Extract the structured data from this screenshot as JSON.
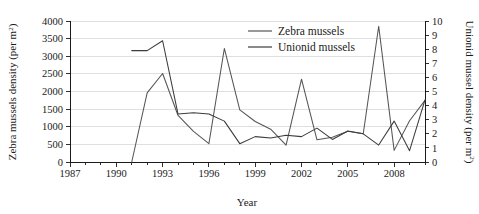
{
  "figure": {
    "background": "#ffffff",
    "plot": {
      "x_px": 70,
      "y_px": 21,
      "w_px": 355,
      "h_px": 141,
      "grid": true
    }
  },
  "axes": {
    "x": {
      "label": "Year",
      "min": 1987,
      "max": 2010,
      "tick_interval_minor": 1,
      "tick_interval_major": 3,
      "major_ticks": [
        1987,
        1990,
        1993,
        1996,
        1999,
        2002,
        2005,
        2008
      ],
      "tick_labels": [
        "1987",
        "1990",
        "1993",
        "1996",
        "1999",
        "2002",
        "2005",
        "2008"
      ]
    },
    "y_left": {
      "label_main": "Zebra mussels density (per m",
      "label_sup": "2",
      "label_close": ")",
      "label_full": "Zebra mussels density (per m²)",
      "min": 0,
      "max": 4000,
      "tick_interval": 500,
      "ticks": [
        0,
        500,
        1000,
        1500,
        2000,
        2500,
        3000,
        3500,
        4000
      ],
      "tick_labels": [
        "0",
        "500",
        "1000",
        "1500",
        "2000",
        "2500",
        "3000",
        "3500",
        "4000"
      ]
    },
    "y_right": {
      "label_main": "Unionid mussel density (per m",
      "label_sup": "2",
      "label_close": ")",
      "label_full": "Unionid mussel density (per m²)",
      "min": 0,
      "max": 10,
      "tick_interval": 1,
      "ticks": [
        0,
        1,
        2,
        3,
        4,
        5,
        6,
        7,
        8,
        9,
        10
      ],
      "tick_labels": [
        "0",
        "1",
        "2",
        "3",
        "4",
        "5",
        "6",
        "7",
        "8",
        "9",
        "10"
      ]
    }
  },
  "legend": {
    "position": "top-center-right",
    "entries": [
      {
        "label": "Zebra mussels",
        "color": "#555555",
        "axis": "y_left"
      },
      {
        "label": "Unionid mussels",
        "color": "#3b3b3b",
        "axis": "y_right"
      }
    ]
  },
  "chart_data": {
    "type": "line",
    "title": "",
    "xlabel": "Year",
    "ylabel": "Zebra mussels density (per m²)",
    "y2label": "Unionid mussel density (per m²)",
    "xlim": [
      1987,
      2010
    ],
    "ylim": [
      0,
      4000
    ],
    "y2lim": [
      0,
      10
    ],
    "grid": true,
    "legend_position": "top-center-right",
    "series": [
      {
        "name": "Zebra mussels",
        "axis": "left",
        "color": "#555555",
        "unit": "per m²",
        "x": [
          1991,
          1992,
          1993,
          1994,
          1995,
          1996,
          1997,
          1998,
          1999,
          2000,
          2001,
          2002,
          2003,
          2004,
          2005,
          2006,
          2007,
          2008,
          2009,
          2010
        ],
        "y": [
          0,
          1960,
          2510,
          1320,
          870,
          520,
          3220,
          1480,
          1150,
          930,
          480,
          2350,
          630,
          700,
          870,
          800,
          3850,
          330,
          1170,
          1750
        ]
      },
      {
        "name": "Unionid mussels",
        "axis": "right",
        "color": "#3b3b3b",
        "unit": "per m²",
        "x": [
          1991,
          1992,
          1993,
          1994,
          1995,
          1996,
          1997,
          1998,
          1999,
          2000,
          2001,
          2002,
          2003,
          2004,
          2005,
          2006,
          2007,
          2008,
          2009,
          2010
        ],
        "y": [
          7.9,
          7.9,
          8.6,
          3.4,
          3.5,
          3.4,
          2.9,
          1.3,
          1.8,
          1.7,
          1.9,
          1.8,
          2.4,
          1.6,
          2.2,
          2.0,
          1.2,
          2.9,
          0.8,
          4.4
        ]
      }
    ]
  }
}
